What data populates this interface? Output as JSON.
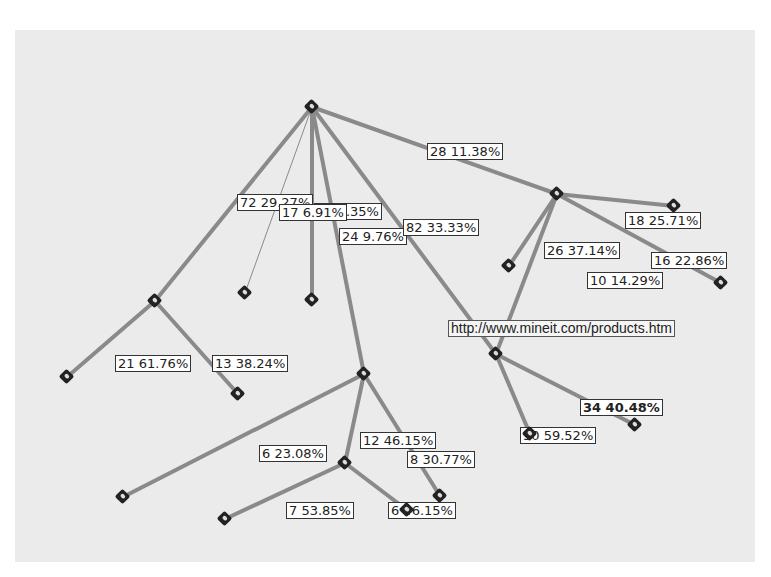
{
  "diagram": {
    "type": "decision-tree",
    "edge_color": "#8a8a8a",
    "node_color": "#222222",
    "background": "#ebebeb",
    "nodes": [
      {
        "id": "root",
        "x": 312,
        "y": 107
      },
      {
        "id": "n1",
        "x": 155,
        "y": 301
      },
      {
        "id": "n2",
        "x": 245,
        "y": 293
      },
      {
        "id": "n3",
        "x": 312,
        "y": 300
      },
      {
        "id": "n4",
        "x": 364,
        "y": 374
      },
      {
        "id": "n5",
        "x": 509,
        "y": 266
      },
      {
        "id": "n6",
        "x": 557,
        "y": 194
      },
      {
        "id": "n7",
        "x": 674,
        "y": 206
      },
      {
        "id": "n8",
        "x": 721,
        "y": 283
      },
      {
        "id": "n9",
        "x": 496,
        "y": 354
      },
      {
        "id": "n10",
        "x": 67,
        "y": 377
      },
      {
        "id": "n11",
        "x": 238,
        "y": 394
      },
      {
        "id": "n12",
        "x": 345,
        "y": 463
      },
      {
        "id": "n13",
        "x": 123,
        "y": 497
      },
      {
        "id": "n14",
        "x": 225,
        "y": 519
      },
      {
        "id": "n15",
        "x": 440,
        "y": 496
      },
      {
        "id": "n16",
        "x": 407,
        "y": 510
      },
      {
        "id": "n17",
        "x": 530,
        "y": 434
      },
      {
        "id": "n18",
        "x": 635,
        "y": 425
      }
    ],
    "edges": [
      {
        "from": "root",
        "to": "n1",
        "w": 4
      },
      {
        "from": "root",
        "to": "n2",
        "w": 1
      },
      {
        "from": "root",
        "to": "n3",
        "w": 4
      },
      {
        "from": "root",
        "to": "n4",
        "w": 4
      },
      {
        "from": "root",
        "to": "n9",
        "w": 4
      },
      {
        "from": "root",
        "to": "n6",
        "w": 4
      },
      {
        "from": "n6",
        "to": "n5",
        "w": 4
      },
      {
        "from": "n6",
        "to": "n7",
        "w": 4
      },
      {
        "from": "n6",
        "to": "n8",
        "w": 4
      },
      {
        "from": "n6",
        "to": "n9",
        "w": 4
      },
      {
        "from": "n1",
        "to": "n10",
        "w": 4
      },
      {
        "from": "n1",
        "to": "n11",
        "w": 4
      },
      {
        "from": "n4",
        "to": "n12",
        "w": 4
      },
      {
        "from": "n4",
        "to": "n13",
        "w": 4
      },
      {
        "from": "n4",
        "to": "n15",
        "w": 4
      },
      {
        "from": "n12",
        "to": "n14",
        "w": 4
      },
      {
        "from": "n12",
        "to": "n16",
        "w": 4
      },
      {
        "from": "n9",
        "to": "n17",
        "w": 4
      },
      {
        "from": "n9",
        "to": "n18",
        "w": 4
      }
    ],
    "labels": [
      {
        "text": "28 11.38%",
        "x": 427,
        "y": 143
      },
      {
        "text": "72 29.27%",
        "x": 237,
        "y": 194
      },
      {
        "text": "23 9.35%",
        "x": 314,
        "y": 203
      },
      {
        "text": "17 6.91%",
        "x": 279,
        "y": 204
      },
      {
        "text": "24 9.76%",
        "x": 339,
        "y": 228
      },
      {
        "text": "82 33.33%",
        "x": 403,
        "y": 219
      },
      {
        "text": "18 25.71%",
        "x": 625,
        "y": 212
      },
      {
        "text": "26 37.14%",
        "x": 544,
        "y": 242
      },
      {
        "text": "16 22.86%",
        "x": 651,
        "y": 252
      },
      {
        "text": "10 14.29%",
        "x": 587,
        "y": 272
      },
      {
        "text": "http://www.mineit.com/products.htm",
        "x": 448,
        "y": 320,
        "style": "url"
      },
      {
        "text": "21 61.76%",
        "x": 115,
        "y": 355
      },
      {
        "text": "13 38.24%",
        "x": 212,
        "y": 355
      },
      {
        "text": "34 40.48%",
        "x": 580,
        "y": 399,
        "style": "bold"
      },
      {
        "text": "50 59.52%",
        "x": 520,
        "y": 427
      },
      {
        "text": "12 46.15%",
        "x": 360,
        "y": 432
      },
      {
        "text": "6 23.08%",
        "x": 259,
        "y": 445
      },
      {
        "text": "8 30.77%",
        "x": 407,
        "y": 451
      },
      {
        "text": "7 53.85%",
        "x": 286,
        "y": 502
      },
      {
        "text": "6 46.15%",
        "x": 388,
        "y": 502
      }
    ]
  }
}
